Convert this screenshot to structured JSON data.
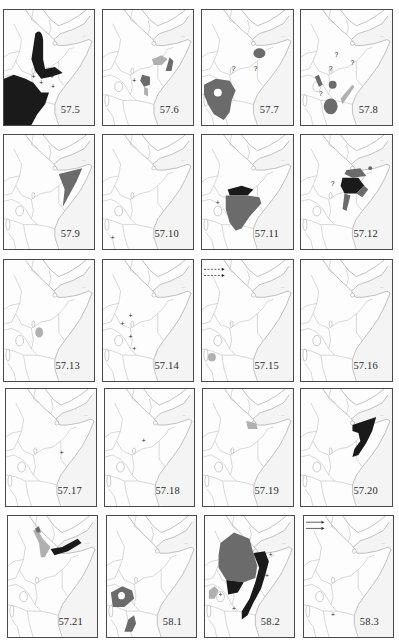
{
  "figure": {
    "colors": {
      "black_range": "#1a1a1a",
      "dark_grey_range": "#6b6b6b",
      "light_grey_range": "#b0b0b0",
      "outline": "#9a9a9a"
    },
    "panels": [
      {
        "label": "57.5",
        "ranges": [
          "black"
        ],
        "marks": [
          "+",
          "+",
          "+",
          "+"
        ]
      },
      {
        "label": "57.6",
        "ranges": [
          "light_grey",
          "dark_grey",
          "dark_grey"
        ],
        "marks": [
          "+"
        ]
      },
      {
        "label": "57.7",
        "ranges": [
          "dark_grey",
          "dark_grey"
        ],
        "marks": [
          "?",
          "?"
        ]
      },
      {
        "label": "57.8",
        "ranges": [
          "dark_grey",
          "dark_grey",
          "dark_grey",
          "light_grey"
        ],
        "marks": [
          "?",
          "?",
          "?",
          "?"
        ]
      },
      {
        "label": "57.9",
        "ranges": [
          "dark_grey"
        ],
        "marks": []
      },
      {
        "label": "57.10",
        "ranges": [],
        "marks": [
          "+"
        ]
      },
      {
        "label": "57.11",
        "ranges": [
          "black",
          "dark_grey"
        ],
        "marks": [
          "+"
        ]
      },
      {
        "label": "57.12",
        "ranges": [
          "black",
          "dark_grey",
          "dark_grey"
        ],
        "marks": [
          "?"
        ]
      },
      {
        "label": "57.13",
        "ranges": [
          "light_grey"
        ],
        "marks": []
      },
      {
        "label": "57.14",
        "ranges": [],
        "marks": [
          "+",
          "+",
          "+",
          "+"
        ]
      },
      {
        "label": "57.15",
        "ranges": [
          "light_grey"
        ],
        "marks": [
          "dashed-arrow",
          "dashed-arrow"
        ]
      },
      {
        "label": "57.16",
        "ranges": [],
        "marks": []
      },
      {
        "label": "57.17",
        "ranges": [],
        "marks": [
          "+"
        ]
      },
      {
        "label": "57.18",
        "ranges": [],
        "marks": [
          "+"
        ]
      },
      {
        "label": "57.19",
        "ranges": [
          "light_grey"
        ],
        "marks": []
      },
      {
        "label": "57.20",
        "ranges": [
          "black"
        ],
        "marks": []
      },
      {
        "label": "57.21",
        "ranges": [
          "light_grey",
          "black"
        ],
        "marks": []
      },
      {
        "label": "58.1",
        "ranges": [
          "dark_grey",
          "dark_grey"
        ],
        "marks": []
      },
      {
        "label": "58.2",
        "ranges": [
          "dark_grey",
          "black",
          "light_grey"
        ],
        "marks": [
          "+",
          "+",
          "+",
          "+"
        ]
      },
      {
        "label": "58.3",
        "ranges": [],
        "marks": [
          "solid-arrow",
          "solid-arrow",
          "+"
        ]
      }
    ]
  }
}
